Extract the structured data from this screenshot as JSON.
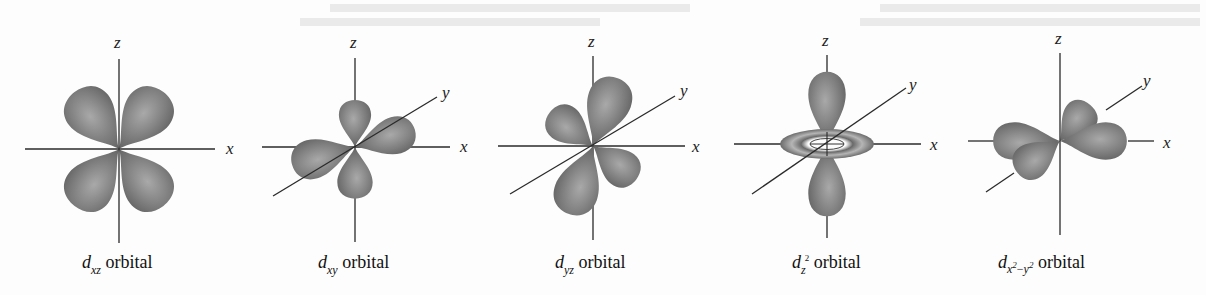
{
  "figure": {
    "colors": {
      "background": "#fdfdfd",
      "lobe_dark": "#6b6b6b",
      "lobe_light": "#a9a9a9",
      "axis": "#2a2a2a",
      "text": "#111111"
    },
    "axis_labels": {
      "x": "x",
      "y": "y",
      "z": "z"
    },
    "orbitals": [
      {
        "id": "dxz",
        "symbol": "d",
        "subscript": "xz",
        "suffix": " orbital",
        "axes_shown": [
          "x",
          "z"
        ]
      },
      {
        "id": "dxy",
        "symbol": "d",
        "subscript": "xy",
        "suffix": " orbital",
        "axes_shown": [
          "x",
          "y",
          "z"
        ]
      },
      {
        "id": "dyz",
        "symbol": "d",
        "subscript": "yz",
        "suffix": " orbital",
        "axes_shown": [
          "x",
          "y",
          "z"
        ]
      },
      {
        "id": "dz2",
        "symbol": "d",
        "subscript": "z",
        "superscript": "2",
        "suffix": " orbital",
        "axes_shown": [
          "x",
          "y",
          "z"
        ]
      },
      {
        "id": "dx2-y2",
        "symbol": "d",
        "subscript_parts": [
          "x",
          "2",
          "−",
          "y",
          "2"
        ],
        "suffix": " orbital",
        "axes_shown": [
          "x",
          "y",
          "z"
        ]
      }
    ]
  }
}
